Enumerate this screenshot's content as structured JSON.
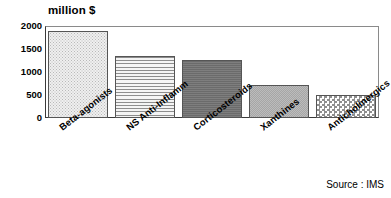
{
  "chart_data": {
    "type": "bar",
    "title": "million $",
    "xlabel": "",
    "ylabel": "million $",
    "ylim": [
      0,
      2000
    ],
    "ytick_labels": [
      "2000",
      "1500",
      "1000",
      "500",
      "0"
    ],
    "ytick_values": [
      2000,
      1500,
      1000,
      500,
      0
    ],
    "grid": false,
    "legend": "none",
    "categories": [
      "Beta-agonists",
      "NS Anti-Inflamm",
      "Corticosteroids",
      "Xanthines",
      "Anticholinergics"
    ],
    "values": [
      1900,
      1350,
      1270,
      710,
      490
    ],
    "bar_styles": [
      "stipple-dots",
      "horizontal-lines",
      "solid-dark-gray",
      "mid-gray",
      "checkerboard"
    ],
    "annotations": [
      "Source : IMS"
    ]
  },
  "notes": {
    "source": "Source : IMS"
  },
  "colors": {
    "axis": "#3a3a3a",
    "frame": "#8a8a8a",
    "bar_outline": "#555555",
    "background": "#ffffff"
  }
}
